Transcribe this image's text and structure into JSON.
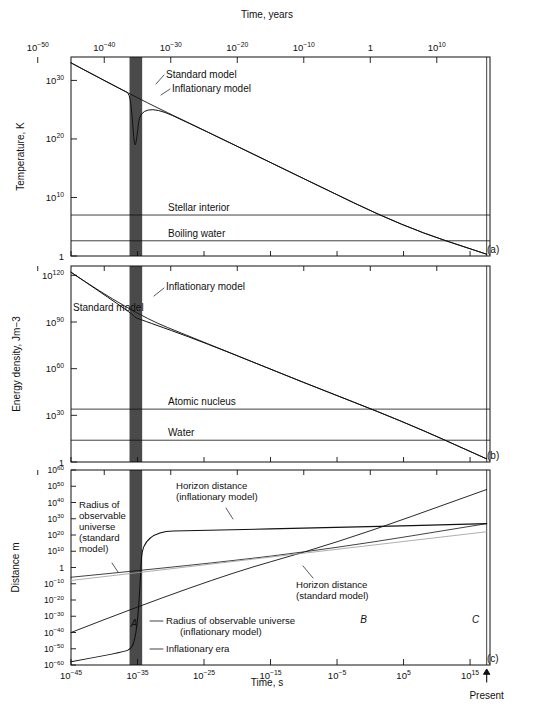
{
  "figure": {
    "top_axis_title": "Time, years",
    "bottom_axis_title": "Time, s",
    "present_label": "Present"
  },
  "top_axis": {
    "ticks": [
      "10-50",
      "10-40",
      "10-30",
      "10-20",
      "10-10",
      "1",
      "1010"
    ],
    "tick_base": [
      "10",
      "10",
      "10",
      "10",
      "10",
      "1",
      "10"
    ],
    "tick_exp": [
      "−50",
      "−40",
      "−30",
      "−20",
      "−10",
      "",
      "10"
    ],
    "values": [
      -50,
      -40,
      -30,
      -20,
      -10,
      0,
      10
    ]
  },
  "bottom_axis": {
    "tick_base": [
      "10",
      "10",
      "10",
      "10",
      "10",
      "10",
      "10"
    ],
    "tick_exp": [
      "−45",
      "−35",
      "−25",
      "−15",
      "−5",
      "5",
      "15"
    ],
    "values": [
      -45,
      -35,
      -25,
      -15,
      -5,
      5,
      15
    ]
  },
  "panels": [
    {
      "id": "a",
      "tag": "(a)",
      "ylabel": "Temperature, K",
      "yticks_base": [
        "10",
        "10",
        "10",
        "1"
      ],
      "yticks_exp": [
        "30",
        "20",
        "10",
        ""
      ],
      "yvalues": [
        30,
        20,
        10,
        0
      ],
      "ylim": [
        0,
        34
      ],
      "hlines": [
        {
          "label": "Stellar interior",
          "value": 7.0
        },
        {
          "label": "Boiling water",
          "value": 2.6
        }
      ],
      "curve_labels": [
        {
          "label": "Standard model"
        },
        {
          "label": "Inflationary model"
        }
      ]
    },
    {
      "id": "b",
      "tag": "(b)",
      "ylabel": "Energy density, Jm−3",
      "yticks_base": [
        "10",
        "10",
        "10",
        "10",
        "1"
      ],
      "yticks_exp": [
        "120",
        "90",
        "60",
        "30",
        ""
      ],
      "yvalues": [
        120,
        90,
        60,
        30,
        0
      ],
      "ylim": [
        0,
        126
      ],
      "hlines": [
        {
          "label": "Atomic nucleus",
          "value": 34.0
        },
        {
          "label": "Water",
          "value": 14.0
        }
      ],
      "curve_labels": [
        {
          "label": "Standard model"
        },
        {
          "label": "Inflationary model"
        }
      ]
    },
    {
      "id": "c",
      "tag": "(c)",
      "ylabel": "Distance m",
      "yticks_base": [
        "10",
        "10",
        "10",
        "10",
        "10",
        "10",
        "1",
        "10",
        "10",
        "10",
        "10",
        "10",
        "10",
        "10"
      ],
      "yticks_exp": [
        "60",
        "50",
        "40",
        "30",
        "20",
        "10",
        "",
        "−10",
        "−20",
        "−30",
        "−40",
        "−50",
        "−60",
        ""
      ],
      "yvalues": [
        60,
        50,
        40,
        30,
        20,
        10,
        0,
        -10,
        -20,
        -30,
        -40,
        -50,
        -60
      ],
      "ylim": [
        -60,
        60
      ],
      "curve_labels": [
        {
          "label": "Horizon distance\n(inflationary model)"
        },
        {
          "label": "Radius of\nobservable\nuniverse\n(standard\nmodel)"
        },
        {
          "label": "Horizon distance\n(standard model)"
        },
        {
          "label": "Radius of observable universe\n(inflationary model)"
        },
        {
          "label": "Inflationary era"
        }
      ],
      "point_markers": [
        "A",
        "B",
        "C"
      ]
    }
  ],
  "chart_data": {
    "type": "line",
    "xlabel": "Time, s",
    "xlabel_top": "Time, years",
    "xlim_log10_seconds": [
      -45,
      18
    ],
    "shaded_region": {
      "name": "inflationary era",
      "x_log10_seconds": [
        -36,
        -34
      ],
      "color": "#4a4a4a"
    },
    "present_time_log10_seconds": 17.5,
    "subplots": [
      {
        "id": "a",
        "ylabel": "Temperature, K",
        "ylim_log10": [
          0,
          34
        ],
        "yticks_log10": [
          0,
          10,
          20,
          30
        ],
        "series": [
          {
            "name": "Standard model",
            "x_log10": [
              -45,
              -36,
              -25,
              -10,
              5,
              17.5
            ],
            "y_log10": [
              33,
              27.5,
              21.5,
              13.2,
              5.0,
              0.3
            ]
          },
          {
            "name": "Inflationary model",
            "x_log10": [
              -45,
              -37,
              -36.2,
              -35.8,
              -35.5,
              -35.2,
              -34.5,
              -25,
              -10,
              5,
              17.5
            ],
            "y_log10": [
              33,
              28.2,
              27.8,
              24.0,
              19.0,
              19.0,
              26.5,
              21.5,
              13.2,
              5.0,
              0.3
            ]
          }
        ],
        "reference_lines": [
          {
            "name": "Stellar interior",
            "y_log10": 7.0
          },
          {
            "name": "Boiling water",
            "y_log10": 2.6
          }
        ]
      },
      {
        "id": "b",
        "ylabel": "Energy density, Jm-3",
        "ylim_log10": [
          0,
          126
        ],
        "yticks_log10": [
          0,
          30,
          60,
          90,
          120
        ],
        "series": [
          {
            "name": "Standard model",
            "x_log10": [
              -45,
              -36,
              -25,
              -10,
              5,
              17.5
            ],
            "y_log10": [
              122,
              96,
              77,
              51,
              26,
              2
            ]
          },
          {
            "name": "Inflationary model",
            "x_log10": [
              -45,
              -36,
              -35.4,
              -34.8,
              -25,
              -10,
              5,
              17.5
            ],
            "y_log10": [
              122,
              96,
              93,
              92,
              77,
              51,
              26,
              2
            ]
          }
        ],
        "reference_lines": [
          {
            "name": "Atomic nucleus",
            "y_log10": 34.0
          },
          {
            "name": "Water",
            "y_log10": 14.0
          }
        ]
      },
      {
        "id": "c",
        "ylabel": "Distance m",
        "ylim_log10": [
          -60,
          60
        ],
        "yticks_log10": [
          -60,
          -50,
          -40,
          -30,
          -20,
          -10,
          0,
          10,
          20,
          30,
          40,
          50,
          60
        ],
        "series": [
          {
            "name": "Horizon distance (inflationary model)",
            "x_log10": [
              -45,
              -25,
              -5,
              17.5
            ],
            "y_log10": [
              -40,
              -8,
              15,
              48
            ]
          },
          {
            "name": "Radius of observable universe (standard model)",
            "x_log10": [
              -45,
              -25,
              -5,
              17.5
            ],
            "y_log10": [
              -40,
              -8,
              15,
              48
            ]
          },
          {
            "name": "Horizon distance (standard model)",
            "x_log10": [
              -45,
              -25,
              -5,
              17.5
            ],
            "y_log10": [
              -6,
              2,
              12,
              27
            ]
          },
          {
            "name": "Radius of observable universe (inflationary model)",
            "x_log10": [
              -45,
              -37,
              -36,
              -35.5,
              -35,
              -34.6,
              -34.2,
              -25,
              -5,
              17.5
            ],
            "y_log10": [
              -58,
              -52,
              -50,
              -46,
              -34,
              -10,
              22,
              23,
              24.5,
              27
            ]
          }
        ],
        "markers": [
          {
            "label": "A",
            "x_log10": -36.5,
            "y_log10": -39
          },
          {
            "label": "B",
            "x_log10": -1,
            "y_log10": -40
          },
          {
            "label": "C",
            "x_log10": 14.5,
            "y_log10": -40
          }
        ]
      }
    ]
  }
}
